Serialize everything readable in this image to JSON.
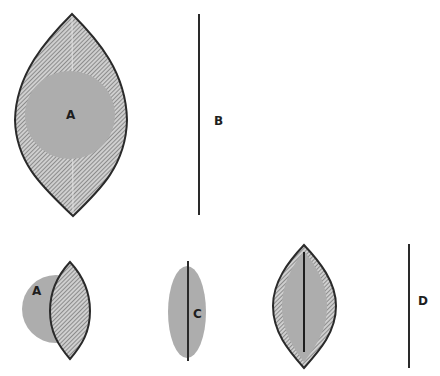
{
  "diagram": {
    "colors": {
      "outline": "#2a2a2a",
      "gray_fill": "#adadad",
      "hatch_bg": "#c8c8c8",
      "hatch_line": "#5a5a5a",
      "background": "#ffffff"
    },
    "labels": {
      "a_top": "A",
      "b": "B",
      "a_bottom": "A",
      "c": "C",
      "d": "D"
    },
    "figures": [
      {
        "id": "top-left",
        "description": "Large hatched lens with gray circle A inside"
      },
      {
        "id": "top-right",
        "description": "Vertical line B"
      },
      {
        "id": "bottom-1",
        "description": "Hatched lens overlapping larger gray circle A"
      },
      {
        "id": "bottom-2",
        "description": "Gray ellipse C with vertical line through it"
      },
      {
        "id": "bottom-3",
        "description": "Hatched lens containing gray lens and vertical line"
      },
      {
        "id": "bottom-4",
        "description": "Vertical line D"
      }
    ]
  }
}
